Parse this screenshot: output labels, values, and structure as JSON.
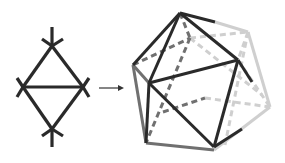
{
  "figure": {
    "colors": {
      "front": "#2a2a2a",
      "mid": "#6e6e6e",
      "back": "#c8c8c8",
      "arrow": "#333333"
    },
    "left_graph": {
      "label": "",
      "vertices": {
        "top": [
          52,
          46
        ],
        "left": [
          23,
          87
        ],
        "right": [
          83,
          87
        ],
        "bottom": [
          52,
          129
        ]
      }
    },
    "arrow": {
      "from": [
        99,
        88
      ],
      "to": [
        124,
        88
      ]
    },
    "right_polyhedron": {
      "name": "icosahedron",
      "label": ""
    }
  }
}
